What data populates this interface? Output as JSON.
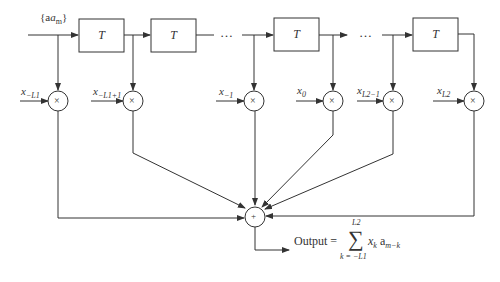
{
  "diagram": {
    "type": "transversal-filter-block-diagram",
    "input_label": "{a_m}",
    "delay_label": "T",
    "delay_count_visible": 4,
    "ellipsis": "…",
    "tap_labels": [
      "x_{-L1}",
      "x_{-L1+1}",
      "x_{-1}",
      "x_0",
      "x_{L2-1}",
      "x_{L2}"
    ],
    "multiplier_symbol": "×",
    "summer_symbol": "+",
    "output": {
      "prefix": "Output =",
      "sum_upper": "L2",
      "sum_lower": "k = −L1",
      "sigma": "∑",
      "term": "x_k a_{m−k}"
    }
  },
  "labels": {
    "input": "{a",
    "input_sub": "m",
    "input_close": "}",
    "T1": "T",
    "T2": "T",
    "T3": "T",
    "T4": "T",
    "dots1": "…",
    "dots2": "…",
    "tap0_main": "x",
    "tap0_sub": "−L1",
    "tap1_main": "x",
    "tap1_sub": "−L1+1",
    "tap2_main": "x",
    "tap2_sub": "−1",
    "tap3_main": "x",
    "tap3_sub": "0",
    "tap4_main": "x",
    "tap4_sub": "L2−1",
    "tap5_main": "x",
    "tap5_sub": "L2",
    "out_prefix": "Output =",
    "out_sigma": "∑",
    "out_upper": "L2",
    "out_lower": "k = −L1",
    "out_term": "x_k a_{m−k}",
    "mult": "×",
    "plus": "+"
  }
}
